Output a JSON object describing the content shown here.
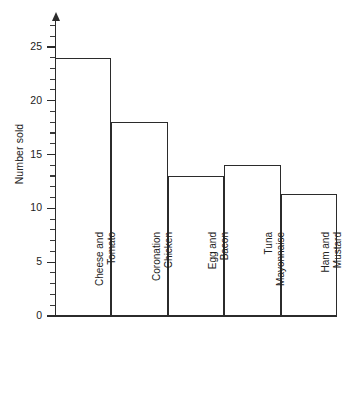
{
  "chart_data": {
    "type": "bar",
    "title": "",
    "subtitle": "",
    "xlabel": "",
    "ylabel": "Number sold",
    "categories": [
      "Cheese and Tomato",
      "Coronation Chicken",
      "Egg and Bacon",
      "Tuna Mayonnaise",
      "Ham and Mustard"
    ],
    "category_lines": [
      [
        "Cheese and",
        "Tomato"
      ],
      [
        "Coronation",
        "Chicken"
      ],
      [
        "Egg and",
        "Bacon"
      ],
      [
        "Tuna",
        "Mayonnaise"
      ],
      [
        "Ham and",
        "Mustard"
      ]
    ],
    "values": [
      24,
      18,
      13,
      14,
      11.3
    ],
    "ylim": [
      0,
      27.5
    ],
    "y_major_ticks": [
      0,
      5,
      10,
      15,
      20,
      25
    ],
    "y_major_tick_labels": [
      "0",
      "5",
      "10",
      "15",
      "20",
      "25"
    ],
    "y_minor_tick_interval": 1,
    "grid": false,
    "legend": "none",
    "bar_fill": "#ffffff",
    "bar_stroke": "#2b2b2b",
    "axis_color": "#2b2b2b",
    "background": "#ffffff",
    "y_axis_has_arrow": true
  }
}
